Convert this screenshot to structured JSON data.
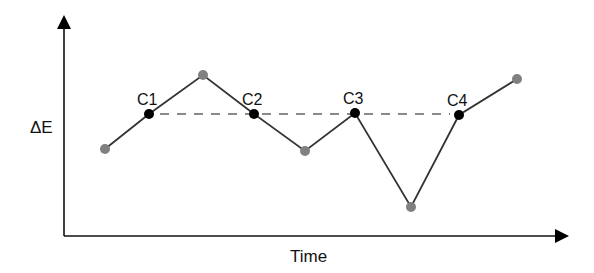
{
  "chart_data": {
    "type": "line",
    "title": "",
    "xlabel": "Time",
    "ylabel": "ΔE",
    "grid": false,
    "legend": null,
    "axis_ticks": "none",
    "series": [
      {
        "name": "energy path",
        "points": [
          {
            "x": 105,
            "y": 149,
            "kind": "state"
          },
          {
            "x": 149,
            "y": 114,
            "kind": "crossing",
            "label": "C1"
          },
          {
            "x": 203,
            "y": 75,
            "kind": "state"
          },
          {
            "x": 254,
            "y": 114,
            "kind": "crossing",
            "label": "C2"
          },
          {
            "x": 305,
            "y": 151,
            "kind": "state"
          },
          {
            "x": 355,
            "y": 113,
            "kind": "crossing",
            "label": "C3"
          },
          {
            "x": 411,
            "y": 207,
            "kind": "state"
          },
          {
            "x": 459,
            "y": 115,
            "kind": "crossing",
            "label": "C4"
          },
          {
            "x": 517,
            "y": 79,
            "kind": "state"
          }
        ]
      }
    ],
    "threshold": {
      "style": "dashed",
      "y": 114,
      "x_start": 160,
      "x_end": 450
    },
    "colors": {
      "line": "#333333",
      "state_point": "#808080",
      "crossing_point": "#000000",
      "threshold": "#8a8a8a",
      "axis": "#111111"
    }
  },
  "labels": {
    "y_axis": "ΔE",
    "x_axis": "Time",
    "c1": "C1",
    "c2": "C2",
    "c3": "C3",
    "c4": "C4"
  }
}
